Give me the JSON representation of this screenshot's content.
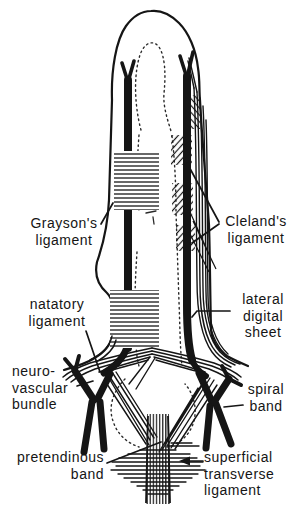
{
  "colors": {
    "ink": "#151515",
    "background": "#ffffff"
  },
  "labels": {
    "graysons": {
      "line1": "Grayson's",
      "line2": "ligament"
    },
    "clelands": {
      "line1": "Cleland's",
      "line2": "ligament"
    },
    "natatory": {
      "line1": "natatory",
      "line2": "ligament"
    },
    "lateral_digital_sheet": {
      "line1": "lateral",
      "line2": "digital",
      "line3": "sheet"
    },
    "neurovascular_bundle": {
      "line1": "neuro-",
      "line2": "vascular",
      "line3": "bundle"
    },
    "spiral_band": {
      "line1": "spiral",
      "line2": "band"
    },
    "pretendinous_band": {
      "line1": "pretendinous",
      "line2": "band"
    },
    "superficial_transverse_ligament": {
      "line1": "superficial",
      "line2": "transverse",
      "line3": "ligament"
    }
  }
}
